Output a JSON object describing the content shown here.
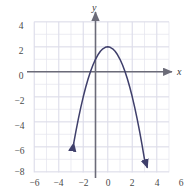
{
  "chart_data": {
    "type": "line",
    "title": "",
    "xlabel": "x",
    "ylabel": "y",
    "xlim": [
      -6.8,
      6.8
    ],
    "ylim": [
      -8.6,
      4.8
    ],
    "xticks": [
      -6,
      -4,
      -2,
      0,
      2,
      4,
      6
    ],
    "xtick_labels": [
      "−6",
      "−4",
      "−2",
      "0",
      "2",
      "4",
      "6"
    ],
    "yticks": [
      4,
      2,
      0,
      -2,
      -4,
      -6,
      -8
    ],
    "ytick_labels": [
      "4",
      "2",
      "0",
      "−2",
      "−4",
      "−6",
      "−8"
    ],
    "grid": true,
    "grid_step": 1,
    "grid_color": "#e3e3ee",
    "axis_color": "#6b6b78",
    "curve_color": "#3f3f6b",
    "legend": null,
    "series": [
      {
        "name": "parabola",
        "equation": "y = -x^2 + 2x + 1",
        "vertex": [
          1,
          2
        ],
        "y_intercept": [
          0,
          1
        ],
        "x_intercepts": [
          -0.414,
          2.414
        ],
        "arrow_start": [
          -1.78,
          -7.7
        ],
        "arrow_end": [
          4.22,
          -7.7
        ],
        "x": [
          -1.78,
          -1.6,
          -1.4,
          -1.2,
          -1.0,
          -0.8,
          -0.6,
          -0.4,
          -0.2,
          0.0,
          0.2,
          0.4,
          0.6,
          0.8,
          1.0,
          1.2,
          1.4,
          1.6,
          1.8,
          2.0,
          2.2,
          2.4,
          2.6,
          2.8,
          3.0,
          3.2,
          3.4,
          3.6,
          3.8,
          4.0,
          4.22
        ],
        "y": [
          -5.73,
          -4.76,
          -3.76,
          -2.84,
          -2.0,
          -1.24,
          -0.56,
          0.04,
          0.56,
          1.0,
          1.36,
          1.64,
          1.84,
          1.96,
          2.0,
          1.96,
          1.84,
          1.64,
          1.36,
          1.0,
          0.56,
          0.04,
          -0.56,
          -1.24,
          -2.0,
          -2.84,
          -3.76,
          -4.76,
          -5.84,
          -7.0,
          -7.63
        ]
      }
    ]
  },
  "axes": {
    "x_axis_label": "x",
    "y_axis_label": "y"
  }
}
